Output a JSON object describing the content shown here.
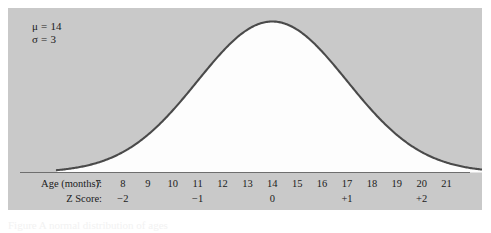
{
  "figure": {
    "panel_bg": "#c9c9c9",
    "curve_color": "#4a4a4a",
    "fill_color": "#fdfdfd",
    "parameters": {
      "mean_label": "μ = 14",
      "sd_label": "σ = 3"
    },
    "axis_rows": [
      {
        "name": "age-row",
        "label": "Age (months):"
      },
      {
        "name": "z-row",
        "label": "Z Score:"
      }
    ],
    "age_ticks": [
      "7",
      "8",
      "9",
      "10",
      "11",
      "12",
      "13",
      "14",
      "15",
      "16",
      "17",
      "18",
      "19",
      "20",
      "21"
    ],
    "z_ticks": [
      {
        "label": "−2",
        "age": 8
      },
      {
        "label": "−1",
        "age": 11
      },
      {
        "label": "0",
        "age": 14
      },
      {
        "label": "+1",
        "age": 17
      },
      {
        "label": "+2",
        "age": 20
      }
    ],
    "caption": "Figure  A normal distribution of ages"
  },
  "chart_data": {
    "type": "line",
    "title": "",
    "xlabel": "Age (months)",
    "ylabel": "",
    "distribution": "normal",
    "mean": 14,
    "sd": 3,
    "xlim": [
      5.4,
      22.8
    ],
    "ylim": [
      0,
      1
    ],
    "grid": false,
    "legend": null,
    "x": [
      5.4,
      6,
      7,
      8,
      9,
      10,
      11,
      12,
      13,
      14,
      15,
      16,
      17,
      18,
      19,
      20,
      21,
      22,
      22.8
    ],
    "y": [
      0.002,
      0.004,
      0.014,
      0.042,
      0.105,
      0.212,
      0.359,
      0.513,
      0.715,
      1.0,
      0.945,
      0.8,
      0.607,
      0.411,
      0.249,
      0.135,
      0.065,
      0.028,
      0.012
    ],
    "annotations": [
      {
        "text": "μ = 14",
        "x": 6.5,
        "y": 0.95
      },
      {
        "text": "σ = 3",
        "x": 6.5,
        "y": 0.88
      }
    ],
    "secondary_axis": {
      "label": "Z Score",
      "ticks": [
        -2,
        -1,
        0,
        1,
        2
      ],
      "tick_labels": [
        "−2",
        "−1",
        "0",
        "+1",
        "+2"
      ]
    }
  }
}
